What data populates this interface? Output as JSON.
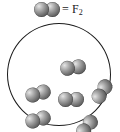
{
  "figure": {
    "type": "molecular-diagram",
    "background_color": "#ffffff"
  },
  "legend": {
    "icon_name": "f2-molecule-icon",
    "equals_sign": "=",
    "formula_symbol": "F",
    "formula_subscript": "2",
    "formula_full": "F2",
    "molecule_color": "#787878"
  },
  "container": {
    "name": "reaction-vessel",
    "shape": "circle",
    "outline_color": "#1c1c1c",
    "fill_color": "#ffffff",
    "molecule_count": 6,
    "molecule_label": "F2"
  },
  "molecules": [
    {
      "id": "mol-top",
      "label": "F2",
      "x": 65,
      "y": 43,
      "rotation": -8
    },
    {
      "id": "mol-left-upper",
      "label": "F2",
      "x": 30,
      "y": 69,
      "rotation": -16
    },
    {
      "id": "mol-center",
      "label": "F2",
      "x": 63,
      "y": 75,
      "rotation": 0
    },
    {
      "id": "mol-right-upper",
      "label": "F2",
      "x": 94,
      "y": 67,
      "rotation": -58
    },
    {
      "id": "mol-left-lower",
      "label": "F2",
      "x": 30,
      "y": 95,
      "rotation": -16
    },
    {
      "id": "mol-right-lower",
      "label": "F2",
      "x": 79,
      "y": 102,
      "rotation": -52
    }
  ]
}
